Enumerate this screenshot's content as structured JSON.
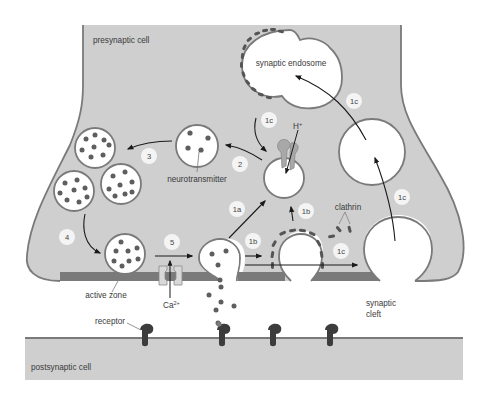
{
  "figure": {
    "colors": {
      "cell_fill": "#cfcfcf",
      "membrane": "#7a7a7a",
      "active_zone": "#7a7a7a",
      "vesicle_fill": "#ffffff",
      "neurotransmitter": "#5e5e5e",
      "clathrin": "#555555",
      "receptor": "#3c3c3c",
      "arrow": "#1a1a1a",
      "step_badge": "#f4f4f4"
    }
  },
  "labels": {
    "presynaptic_cell": "presynaptic cell",
    "postsynaptic_cell": "postsynaptic cell",
    "synaptic_endosome": "synaptic endosome",
    "neurotransmitter": "neurotransmitter",
    "active_zone": "active zone",
    "receptor": "receptor",
    "clathrin": "clathrin",
    "synaptic_cleft_line1": "synaptic",
    "synaptic_cleft_line2": "cleft",
    "calcium": "Ca",
    "calcium_charge": "2+",
    "proton": "H",
    "proton_charge": "+"
  },
  "steps": [
    {
      "id": "1a",
      "label": "1a"
    },
    {
      "id": "1b-upper",
      "label": "1b"
    },
    {
      "id": "1b-lower",
      "label": "1b"
    },
    {
      "id": "1c-endosome-out",
      "label": "1c"
    },
    {
      "id": "1c-to-endosome",
      "label": "1c"
    },
    {
      "id": "1c-lower-right",
      "label": "1c"
    },
    {
      "id": "1c-clathrin",
      "label": "1c"
    },
    {
      "id": "2",
      "label": "2"
    },
    {
      "id": "3",
      "label": "3"
    },
    {
      "id": "4",
      "label": "4"
    },
    {
      "id": "5",
      "label": "5"
    }
  ]
}
